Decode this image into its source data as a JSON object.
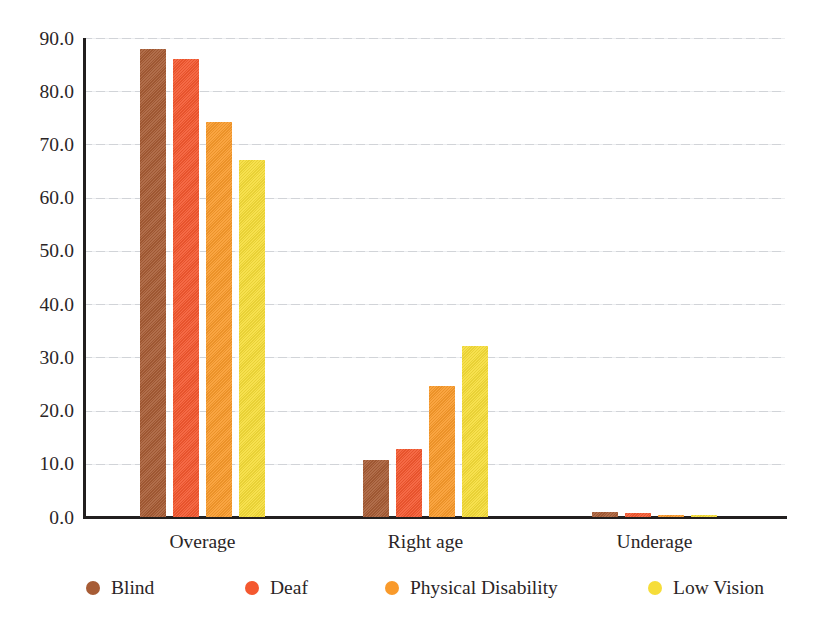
{
  "chart_data": {
    "type": "bar",
    "title": "",
    "subtitle": "",
    "xlabel": "",
    "ylabel": "",
    "categories": [
      "Overage",
      "Right age",
      "Underage"
    ],
    "series": [
      {
        "name": "Blind",
        "color": "#a75c35",
        "values": [
          88.0,
          10.8,
          1.0
        ]
      },
      {
        "name": "Deaf",
        "color": "#f4582f",
        "values": [
          86.1,
          12.8,
          0.7
        ]
      },
      {
        "name": "Physical Disability",
        "color": "#f99a2b",
        "values": [
          74.3,
          24.6,
          0.4
        ]
      },
      {
        "name": "Low Vision",
        "color": "#f6dd39",
        "values": [
          67.0,
          32.2,
          0.3
        ]
      }
    ],
    "ylim": [
      0,
      90
    ],
    "ytick_values": [
      0,
      10,
      20,
      30,
      40,
      50,
      60,
      70,
      80,
      90
    ],
    "ytick_labels": [
      "0.0",
      "10.0",
      "20.0",
      "30.0",
      "40.0",
      "50.0",
      "60.0",
      "70.0",
      "80.0",
      "90.0"
    ],
    "grid": true,
    "grid_axis": "y",
    "grid_color": "#c9ccd1",
    "legend_position": "bottom",
    "axis_color": "#221f1f",
    "background": "#ffffff"
  }
}
